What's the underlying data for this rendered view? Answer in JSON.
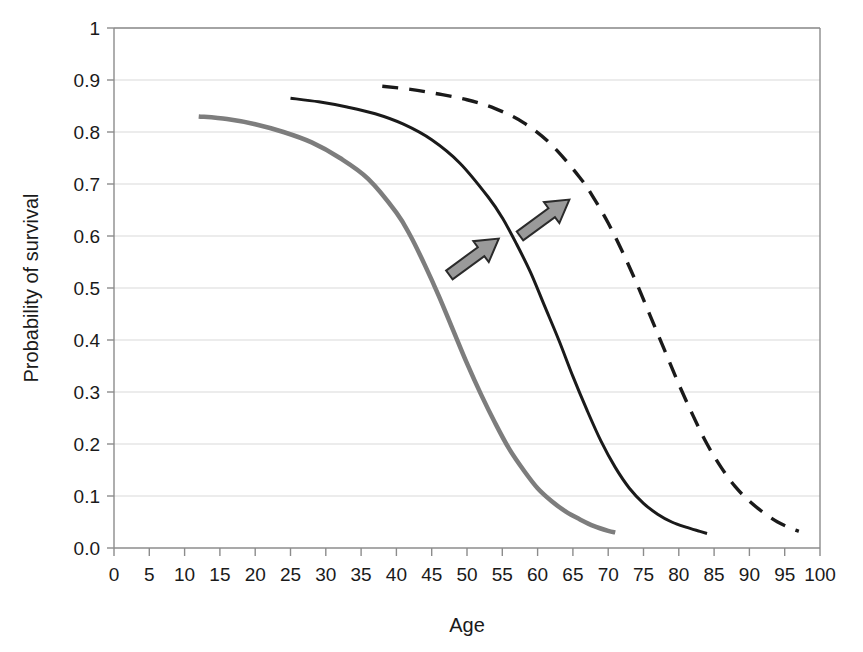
{
  "chart_data": {
    "type": "line",
    "title": "",
    "xlabel": "Age",
    "ylabel": "Probability of survival",
    "xlim": [
      0,
      100
    ],
    "ylim": [
      0,
      1
    ],
    "grid": "horizontal",
    "legend": "none",
    "xticks": [
      "0",
      "5",
      "10",
      "15",
      "20",
      "25",
      "30",
      "35",
      "40",
      "45",
      "50",
      "55",
      "60",
      "65",
      "70",
      "75",
      "80",
      "85",
      "90",
      "95",
      "100"
    ],
    "yticks": [
      "0.0",
      "0.1",
      "0.2",
      "0.3",
      "0.4",
      "0.5",
      "0.6",
      "0.7",
      "0.8",
      "0.9",
      "1"
    ],
    "series": [
      {
        "name": "baseline-survival-curve",
        "style": "solid",
        "color": "#7d7d7d",
        "width": 4.5,
        "x": [
          12,
          16,
          20,
          24,
          28,
          32,
          36,
          40,
          42,
          44,
          46,
          48,
          50,
          52,
          54,
          56,
          58,
          60,
          62,
          64,
          66,
          68,
          70,
          71
        ],
        "y": [
          0.83,
          0.825,
          0.815,
          0.8,
          0.78,
          0.75,
          0.71,
          0.645,
          0.6,
          0.545,
          0.485,
          0.42,
          0.355,
          0.295,
          0.24,
          0.19,
          0.15,
          0.115,
          0.09,
          0.07,
          0.055,
          0.042,
          0.033,
          0.03
        ]
      },
      {
        "name": "intermediate-survival-curve",
        "style": "solid",
        "color": "#1a1a1a",
        "width": 3.0,
        "x": [
          25,
          29,
          33,
          37,
          41,
          45,
          49,
          53,
          55,
          57,
          59,
          61,
          63,
          65,
          67,
          69,
          71,
          73,
          75,
          77,
          79,
          81,
          83,
          84
        ],
        "y": [
          0.865,
          0.858,
          0.848,
          0.835,
          0.815,
          0.785,
          0.74,
          0.675,
          0.635,
          0.585,
          0.53,
          0.465,
          0.4,
          0.33,
          0.265,
          0.205,
          0.155,
          0.115,
          0.086,
          0.065,
          0.05,
          0.04,
          0.032,
          0.028
        ]
      },
      {
        "name": "shifted-survival-curve",
        "style": "dashed",
        "color": "#1a1a1a",
        "width": 3.4,
        "dash": "16,11",
        "x": [
          38,
          42,
          46,
          50,
          54,
          58,
          62,
          66,
          68,
          70,
          72,
          74,
          76,
          78,
          80,
          82,
          84,
          86,
          88,
          90,
          92,
          94,
          96,
          97
        ],
        "y": [
          0.888,
          0.882,
          0.873,
          0.862,
          0.845,
          0.818,
          0.775,
          0.712,
          0.672,
          0.625,
          0.57,
          0.51,
          0.445,
          0.38,
          0.315,
          0.255,
          0.2,
          0.155,
          0.118,
          0.09,
          0.068,
          0.05,
          0.037,
          0.032
        ]
      }
    ],
    "annotations": [
      {
        "name": "shift-arrow-lower",
        "kind": "arrow",
        "x_start": 47.5,
        "y_start": 0.525,
        "x_end": 54.5,
        "y_end": 0.595,
        "fill": "#9a9a9a",
        "stroke": "#2b2b2b"
      },
      {
        "name": "shift-arrow-upper",
        "kind": "arrow",
        "x_start": 57.5,
        "y_start": 0.6,
        "x_end": 64.5,
        "y_end": 0.67,
        "fill": "#9a9a9a",
        "stroke": "#2b2b2b"
      }
    ],
    "colors": {
      "grid": "#d9d9d9",
      "axis": "#8c8c8c",
      "text": "#1a1a1a",
      "background": "#ffffff"
    }
  }
}
